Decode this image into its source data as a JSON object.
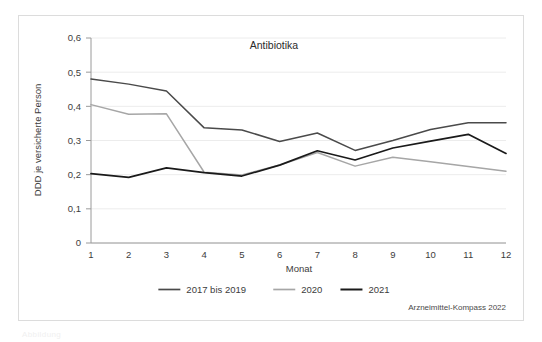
{
  "figure": {
    "background_color": "#ffffff",
    "frame_color": "#dcdcdc",
    "source_note": "Arzneimittel-Kompass 2022",
    "caption_fragment": "Abbildung"
  },
  "chart_data": {
    "type": "line",
    "title": "Antibiotika",
    "xlabel": "Monat",
    "ylabel": "DDD je versicherte Person",
    "categories": [
      "1",
      "2",
      "3",
      "4",
      "5",
      "6",
      "7",
      "8",
      "9",
      "10",
      "11",
      "12"
    ],
    "x": [
      1,
      2,
      3,
      4,
      5,
      6,
      7,
      8,
      9,
      10,
      11,
      12
    ],
    "xlim": [
      1,
      12
    ],
    "ylim": [
      0,
      0.6
    ],
    "ytick_labels": [
      "0",
      "0,1",
      "0,2",
      "0,3",
      "0,4",
      "0,5",
      "0,6"
    ],
    "ytick_values": [
      0,
      0.1,
      0.2,
      0.3,
      0.4,
      0.5,
      0.6
    ],
    "grid": true,
    "grid_axis": "y",
    "legend_position": "bottom",
    "decimal_separator": ",",
    "series": [
      {
        "name": "2017 bis 2019",
        "color": "#4a4a4a",
        "values": [
          0.48,
          0.465,
          0.445,
          0.337,
          0.331,
          0.297,
          0.322,
          0.271,
          0.3,
          0.332,
          0.352,
          0.352
        ]
      },
      {
        "name": "2020",
        "color": "#a6a6a6",
        "values": [
          0.405,
          0.377,
          0.378,
          0.207,
          0.199,
          0.228,
          0.265,
          0.225,
          0.251,
          0.238,
          0.224,
          0.21
        ]
      },
      {
        "name": "2021",
        "color": "#1a1a1a",
        "values": [
          0.203,
          0.192,
          0.22,
          0.206,
          0.196,
          0.228,
          0.27,
          0.243,
          0.278,
          0.298,
          0.318,
          0.262
        ]
      }
    ]
  }
}
